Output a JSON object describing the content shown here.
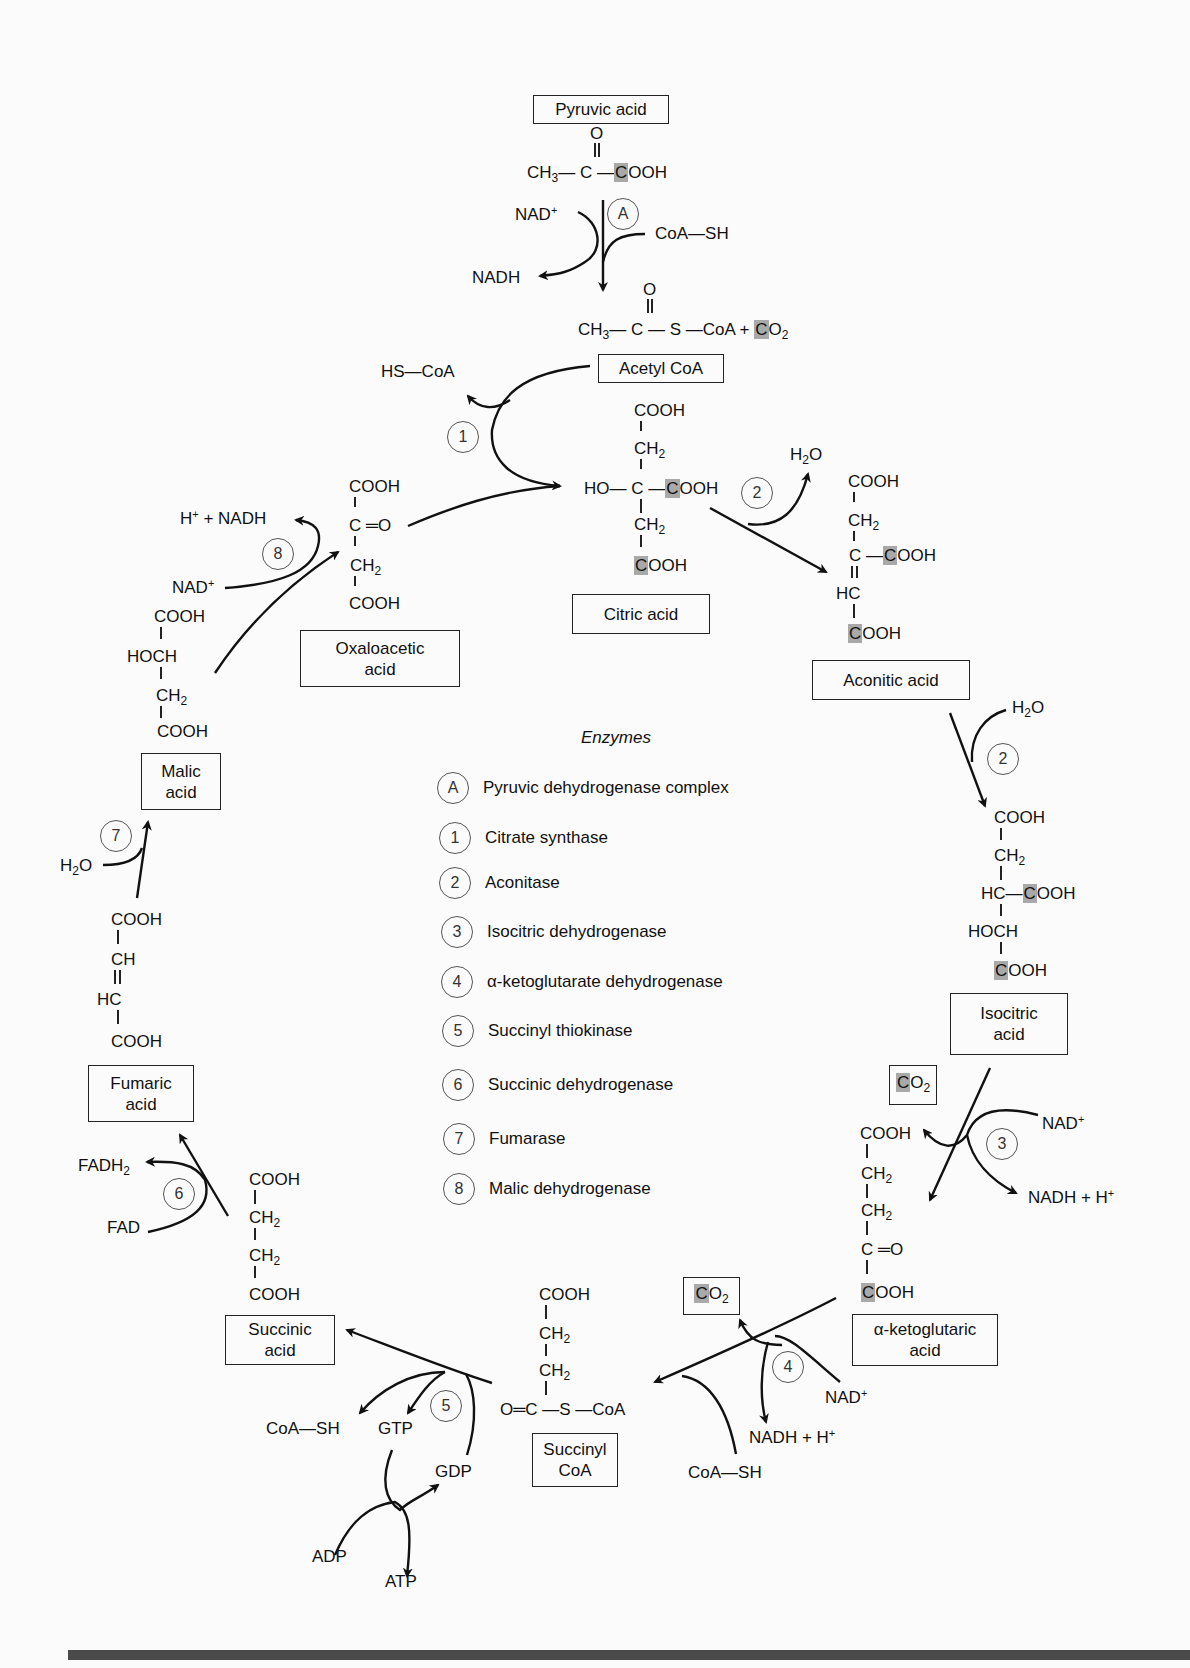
{
  "highlight_color": "#a9a9a9",
  "compounds": {
    "pyruvic_acid": {
      "label": "Pyruvic acid",
      "formula": [
        "O",
        "CH3—C—COOH"
      ]
    },
    "acetyl_coa": {
      "label": "Acetyl CoA",
      "formula": [
        "O",
        "CH3—C—S—CoA + CO2"
      ]
    },
    "citric_acid": {
      "label": "Citric acid",
      "formula": [
        "COOH",
        "CH2",
        "HO—C—COOH",
        "CH2",
        "COOH"
      ]
    },
    "aconitic_acid": {
      "label": "Aconitic acid",
      "formula": [
        "COOH",
        "CH2",
        "C—COOH",
        "HC",
        "COOH"
      ]
    },
    "isocitric_acid": {
      "label_line1": "Isocitric",
      "label_line2": "acid",
      "formula": [
        "COOH",
        "CH2",
        "HC—COOH",
        "HOCH",
        "COOH"
      ]
    },
    "alpha_ketoglutaric_acid": {
      "label_line1": "α-ketoglutaric",
      "label_line2": "acid",
      "formula": [
        "COOH",
        "CH2",
        "CH2",
        "C=O",
        "COOH"
      ]
    },
    "succinyl_coa": {
      "label_line1": "Succinyl",
      "label_line2": "CoA",
      "formula": [
        "COOH",
        "CH2",
        "CH2",
        "O=C—S—CoA"
      ]
    },
    "succinic_acid": {
      "label_line1": "Succinic",
      "label_line2": "acid",
      "formula": [
        "COOH",
        "CH2",
        "CH2",
        "COOH"
      ]
    },
    "fumaric_acid": {
      "label_line1": "Fumaric",
      "label_line2": "acid",
      "formula": [
        "COOH",
        "CH",
        "HC",
        "COOH"
      ]
    },
    "malic_acid": {
      "label_line1": "Malic",
      "label_line2": "acid",
      "formula": [
        "COOH",
        "HOCH",
        "CH2",
        "COOH"
      ]
    },
    "oxaloacetic_acid": {
      "label_line1": "Oxaloacetic",
      "label_line2": "acid",
      "formula": [
        "COOH",
        "C=O",
        "CH2",
        "COOH"
      ]
    }
  },
  "cofactors": {
    "nad_plus": "NAD",
    "nadh": "NADH",
    "coa_sh": "CoA—SH",
    "hs_coa": "HS—CoA",
    "h2o": "H2O",
    "co2": "CO2",
    "nadh_h": "NADH + H",
    "h_nadh": "H + NADH",
    "fadh2": "FADH2",
    "fad": "FAD",
    "gtp": "GTP",
    "gdp": "GDP",
    "adp": "ADP",
    "atp": "ATP"
  },
  "legend": {
    "title": "Enzymes",
    "items": [
      {
        "key": "A",
        "label": "Pyruvic dehydrogenase complex"
      },
      {
        "key": "1",
        "label": "Citrate synthase"
      },
      {
        "key": "2",
        "label": "Aconitase"
      },
      {
        "key": "3",
        "label": "Isocitric dehydrogenase"
      },
      {
        "key": "4",
        "label": "α-ketoglutarate dehydrogenase"
      },
      {
        "key": "5",
        "label": "Succinyl thiokinase"
      },
      {
        "key": "6",
        "label": "Succinic dehydrogenase"
      },
      {
        "key": "7",
        "label": "Fumarase"
      },
      {
        "key": "8",
        "label": "Malic dehydrogenase"
      }
    ]
  },
  "step_markers": [
    "A",
    "1",
    "2",
    "2",
    "3",
    "4",
    "5",
    "6",
    "7",
    "8"
  ]
}
